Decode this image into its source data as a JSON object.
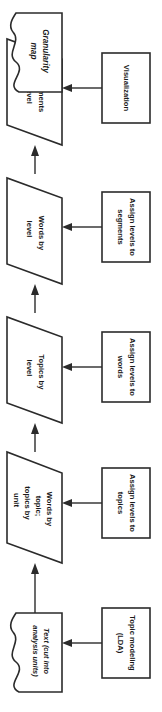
{
  "diagram": {
    "orientation": "vertical-bottom-to-top",
    "colors": {
      "stroke": "#2b2b2b",
      "fill": "#ffffff",
      "text": "#1a1a1a",
      "background": "#ffffff"
    },
    "process_nodes": [
      {
        "id": "topic-modeling",
        "label_lines": [
          "Topic modeling",
          "(LDA)"
        ],
        "shape": "rectangle"
      },
      {
        "id": "assign-levels-topics",
        "label_lines": [
          "Assign levels to",
          "topics"
        ],
        "shape": "rectangle"
      },
      {
        "id": "assign-levels-words",
        "label_lines": [
          "Assign levels to",
          "words"
        ],
        "shape": "rectangle"
      },
      {
        "id": "assign-levels-segments",
        "label_lines": [
          "Assign levels to",
          "segments"
        ],
        "shape": "rectangle"
      },
      {
        "id": "visualization",
        "label_lines": [
          "Visualization"
        ],
        "shape": "rectangle"
      }
    ],
    "data_nodes": [
      {
        "id": "text-input",
        "label_lines": [
          "Text (cut into",
          "analysis units)"
        ],
        "shape": "document",
        "italic": true
      },
      {
        "id": "words-topics",
        "label_lines": [
          "Words by",
          "topic;",
          "topics by",
          "unit"
        ],
        "shape": "parallelogram",
        "italic": false
      },
      {
        "id": "topics-by-level",
        "label_lines": [
          "Topics by",
          "level"
        ],
        "shape": "parallelogram",
        "italic": false
      },
      {
        "id": "words-by-level",
        "label_lines": [
          "Words by",
          "level"
        ],
        "shape": "parallelogram",
        "italic": false
      },
      {
        "id": "segments-by-level",
        "label_lines": [
          "Segments",
          "by level"
        ],
        "shape": "parallelogram",
        "italic": false
      },
      {
        "id": "granularity-map",
        "label_lines": [
          "Granularity",
          "map"
        ],
        "shape": "document",
        "italic": true
      }
    ],
    "edges": [
      {
        "from": "topic-modeling",
        "to": "text-input",
        "kind": "process-to-data"
      },
      {
        "from": "assign-levels-topics",
        "to": "words-topics",
        "kind": "process-to-data"
      },
      {
        "from": "assign-levels-words",
        "to": "topics-by-level",
        "kind": "process-to-data"
      },
      {
        "from": "assign-levels-segments",
        "to": "words-by-level",
        "kind": "process-to-data"
      },
      {
        "from": "visualization",
        "to": "segments-by-level",
        "kind": "process-to-data"
      },
      {
        "from": "text-input",
        "to": "words-topics",
        "kind": "data-flow"
      },
      {
        "from": "words-topics",
        "to": "topics-by-level",
        "kind": "data-flow"
      },
      {
        "from": "topics-by-level",
        "to": "words-by-level",
        "kind": "data-flow"
      },
      {
        "from": "words-by-level",
        "to": "segments-by-level",
        "kind": "data-flow"
      },
      {
        "from": "segments-by-level",
        "to": "granularity-map",
        "kind": "data-flow"
      }
    ]
  }
}
